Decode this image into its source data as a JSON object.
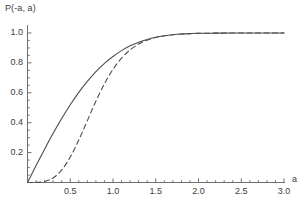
{
  "chart_data": {
    "type": "line",
    "title": "",
    "xlabel": "a",
    "ylabel": "P(-a, a)",
    "xlim": [
      0,
      3.0
    ],
    "ylim": [
      0,
      1.04
    ],
    "grid": false,
    "legend": "none",
    "xticks": [
      "0.5",
      "1.0",
      "1.5",
      "2.0",
      "2.5",
      "3.0"
    ],
    "xtick_values": [
      0.5,
      1.0,
      1.5,
      2.0,
      2.5,
      3.0
    ],
    "yticks": [
      "0.2",
      "0.4",
      "0.6",
      "0.8",
      "1.0"
    ],
    "ytick_values": [
      0.2,
      0.4,
      0.6,
      0.8,
      1.0
    ],
    "x": [
      0.0,
      0.1,
      0.2,
      0.3,
      0.4,
      0.5,
      0.6,
      0.7,
      0.8,
      0.9,
      1.0,
      1.1,
      1.2,
      1.3,
      1.4,
      1.5,
      1.6,
      1.7,
      1.8,
      1.9,
      2.0,
      2.2,
      2.4,
      2.6,
      2.8,
      3.0
    ],
    "series": [
      {
        "name": "solid-curve",
        "style": "solid",
        "color": "#4d4d4d",
        "values": [
          0.0,
          0.113,
          0.223,
          0.329,
          0.428,
          0.52,
          0.603,
          0.676,
          0.741,
          0.797,
          0.843,
          0.882,
          0.914,
          0.938,
          0.957,
          0.971,
          0.981,
          0.988,
          0.993,
          0.996,
          0.998,
          0.999,
          1.0,
          1.0,
          1.0,
          1.0
        ]
      },
      {
        "name": "dashed-curve",
        "style": "dashed",
        "color": "#4d4d4d",
        "values": [
          0.0,
          0.0005,
          0.008,
          0.03,
          0.084,
          0.17,
          0.285,
          0.414,
          0.544,
          0.66,
          0.757,
          0.832,
          0.887,
          0.926,
          0.952,
          0.97,
          0.981,
          0.988,
          0.993,
          0.996,
          0.998,
          0.999,
          1.0,
          1.0,
          1.0,
          1.0
        ]
      }
    ]
  }
}
